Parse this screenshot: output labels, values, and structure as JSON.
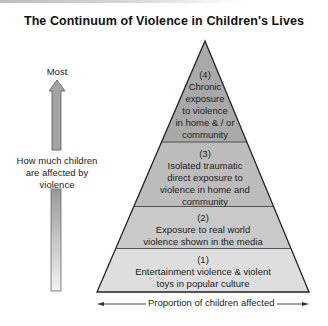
{
  "title": "The Continuum of Violence in Children's Lives",
  "y_axis": {
    "top_label": "Most",
    "label_lines": [
      "How much children",
      "are affected by",
      "violence"
    ],
    "arrow_direction": "up",
    "arrow-icon": "up-arrow-icon"
  },
  "x_axis": {
    "label": "Proportion of children affected",
    "arrow_direction": "both"
  },
  "pyramid": {
    "levels": [
      {
        "number": "(4)",
        "lines": [
          "Chronic",
          "exposure",
          "to violence",
          "in home & / or",
          "community"
        ],
        "color": "#a9a9a9"
      },
      {
        "number": "(3)",
        "lines": [
          "Isolated traumatic",
          "direct exposure to",
          "violence in home and",
          "community"
        ],
        "color": "#bcbcbc"
      },
      {
        "number": "(2)",
        "lines": [
          "Exposure to real world",
          "violence shown in the media"
        ],
        "color": "#c9c9c9"
      },
      {
        "number": "(1)",
        "lines": [
          "Entertainment violence & violent",
          "toys in popular culture"
        ],
        "color": "#dedede"
      }
    ]
  },
  "colors": {
    "outline": "#222222",
    "arrow_top": "#9a9a9a",
    "arrow_bottom": "#f2f2f2"
  }
}
